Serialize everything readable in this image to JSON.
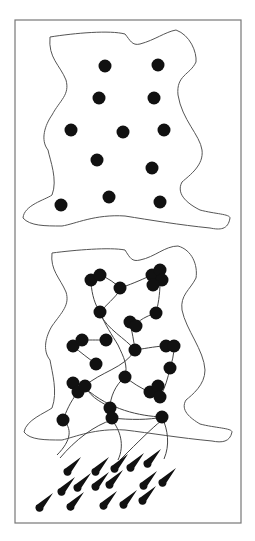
{
  "figure": {
    "width": 255,
    "height": 541,
    "frame": {
      "x": 15,
      "y": 20,
      "w": 226,
      "h": 503,
      "stroke": "#777777"
    },
    "outline_stroke": "#555555",
    "node_fill": "#111111",
    "edge_stroke": "#444444"
  },
  "panels": [
    {
      "name": "dispersed-particles",
      "outline": "M50,37 C75,33 110,30 125,34 C130,40 132,46 140,44 C155,40 165,32 176,30 C190,35 197,52 196,62 C190,75 176,75 178,95 C182,120 200,135 202,150 C204,165 190,175 182,182 C175,195 190,205 200,210 C215,214 230,214 230,218 C228,230 220,230 210,228 C180,225 150,220 125,216 C95,214 75,224 62,226 C45,226 30,226 23,218 C24,205 45,200 52,195 C58,180 50,160 48,150 C40,140 45,125 52,115 C60,100 70,95 66,80 C60,65 48,58 50,37 Z",
      "nodes": [
        [
          105,
          66
        ],
        [
          158,
          65
        ],
        [
          99,
          98
        ],
        [
          154,
          98
        ],
        [
          71,
          130
        ],
        [
          123,
          132
        ],
        [
          164,
          130
        ],
        [
          97,
          160
        ],
        [
          152,
          168
        ],
        [
          109,
          197
        ],
        [
          160,
          202
        ],
        [
          61,
          205
        ]
      ]
    },
    {
      "name": "networked-particles",
      "outline": "M52,253 C75,250 110,247 125,250 C130,258 132,262 140,260 C155,257 165,246 178,246 C192,250 198,265 196,278 C190,290 180,295 182,310 C186,330 204,350 205,370 C205,385 192,395 186,400 C180,410 190,418 200,424 C215,428 232,428 232,432 C230,442 222,443 212,441 C180,438 150,433 125,430 C95,428 75,437 62,440 C45,440 30,440 24,432 C26,420 45,413 52,408 C58,392 52,372 50,360 C42,350 46,336 52,326 C62,312 70,305 66,292 C60,278 50,270 52,253 Z",
      "nodes": [
        [
          91,
          280
        ],
        [
          100,
          275
        ],
        [
          120,
          288
        ],
        [
          152,
          275
        ],
        [
          160,
          270
        ],
        [
          162,
          280
        ],
        [
          153,
          285
        ],
        [
          100,
          312
        ],
        [
          156,
          313
        ],
        [
          130,
          322
        ],
        [
          136,
          326
        ],
        [
          73,
          346
        ],
        [
          82,
          340
        ],
        [
          106,
          340
        ],
        [
          135,
          350
        ],
        [
          166,
          346
        ],
        [
          174,
          346
        ],
        [
          170,
          368
        ],
        [
          96,
          364
        ],
        [
          73,
          383
        ],
        [
          78,
          392
        ],
        [
          85,
          386
        ],
        [
          125,
          377
        ],
        [
          150,
          392
        ],
        [
          158,
          386
        ],
        [
          160,
          397
        ],
        [
          110,
          408
        ],
        [
          112,
          418
        ],
        [
          162,
          417
        ],
        [
          63,
          420
        ]
      ],
      "edges": [
        "M91,283 C92,295 95,305 100,312",
        "M100,275 C108,278 115,283 120,288",
        "M120,288 C135,283 145,278 152,275",
        "M120,290 C115,298 106,305 100,312",
        "M160,282 C160,295 158,305 156,313",
        "M156,313 C150,315 142,318 136,324",
        "M100,312 C105,325 112,335 118,345 C124,358 128,365 125,377",
        "M100,314 C108,330 125,338 135,350",
        "M82,340 C92,340 100,340 106,340",
        "M130,322 C132,332 134,342 135,350",
        "M135,350 C148,348 158,346 166,346",
        "M174,346 C174,355 172,362 170,368",
        "M73,346 C80,352 88,358 96,364",
        "M135,350 C125,368 100,372 85,386",
        "M170,368 C168,378 165,388 160,397",
        "M125,377 C133,383 140,388 150,392",
        "M78,392 C70,402 66,412 63,420",
        "M85,386 C92,400 105,403 110,408",
        "M112,418 C130,420 150,420 162,417",
        "M125,377 C115,385 110,398 110,408",
        "M85,388 C110,410 140,416 162,417",
        "M63,420 C72,428 72,440 57,455",
        "M112,420 C95,425 75,440 60,458",
        "M112,420 C120,430 125,445 118,460",
        "M162,417 C168,430 170,445 164,459",
        "M162,420 C150,430 140,440 120,460"
      ]
    }
  ],
  "drops": [
    [
      70,
      468
    ],
    [
      98,
      468
    ],
    [
      117,
      465
    ],
    [
      133,
      464
    ],
    [
      150,
      460
    ],
    [
      64,
      488
    ],
    [
      80,
      484
    ],
    [
      98,
      483
    ],
    [
      112,
      481
    ],
    [
      146,
      482
    ],
    [
      165,
      479
    ],
    [
      42,
      504
    ],
    [
      73,
      503
    ],
    [
      106,
      502
    ],
    [
      126,
      501
    ],
    [
      145,
      497
    ]
  ]
}
